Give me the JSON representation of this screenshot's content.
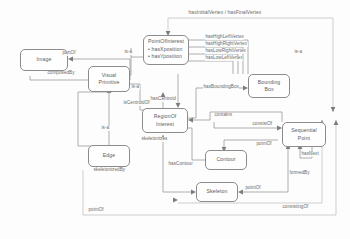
{
  "diagram": {
    "type": "ontology-class-diagram",
    "colors": {
      "node_border": "#8c8c8c",
      "node_fill": "#fefefe",
      "text": "#5d5d5d",
      "edge": "#9a9a9a",
      "label": "#6a6a6a",
      "background": "#fdfdfd"
    },
    "nodes": [
      {
        "id": "image",
        "label_line1": "Image"
      },
      {
        "id": "visual_primitive",
        "label_line1": "Visual",
        "label_line2": "Primitive"
      },
      {
        "id": "edge",
        "label_line1": "Edge"
      },
      {
        "id": "point_of_interest",
        "label_line1": "PointOfInterest",
        "attributes": [
          "• hasXposition",
          "• hasYposition"
        ]
      },
      {
        "id": "bounding_box",
        "label_line1": "Bounding",
        "label_line2": "Box"
      },
      {
        "id": "region_of_interest",
        "label_line1": "RegionOf",
        "label_line2": "Interest"
      },
      {
        "id": "contour",
        "label_line1": "Contour"
      },
      {
        "id": "sequential_point",
        "label_line1": "Sequential",
        "label_line2": "Point"
      },
      {
        "id": "skeleton",
        "label_line1": "Skeleton"
      }
    ],
    "edge_labels": {
      "has_initial_final_vertex": "hasInitialVertex / hasFinalVertex",
      "has_high_left_vertex": "hasHighLeftVertex",
      "has_high_right_vertex": "hasHighRightVertex",
      "has_low_right_vertex": "hasLowRightVertex",
      "has_low_left_vertex": "hasLowLeftVertex",
      "part_of": "partOf",
      "composed_by": "composedBy",
      "is_a_poi": "is-a",
      "is_a_roi": "is-a",
      "is_a_edge": "is-a",
      "is_a_right": "is-a",
      "has_centroid": "hasCentroid",
      "is_centroid_of": "isCentroidOf",
      "has_bounding_box": "hasBoundingBox",
      "contains": "contains",
      "skeletonizes": "skeletonizes",
      "skeletonized_by": "skeletonizedBy",
      "has_contour": "hasContour",
      "consist_of": "consistOf",
      "point_of_contour": "pointOf",
      "has_next": "hasNext",
      "formed_by": "formedBy",
      "point_of_skeleton": "pointOf",
      "point_of_bottom": "pointOf",
      "consisting_of": "consistingOf"
    }
  }
}
